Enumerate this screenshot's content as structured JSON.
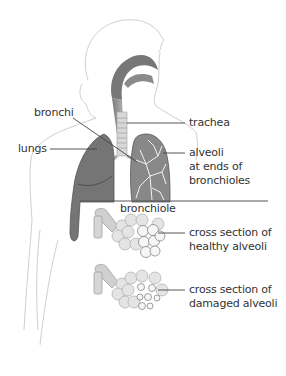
{
  "diagram": {
    "labels": {
      "bronchi": "bronchi",
      "lungs": "lungs",
      "trachea": "trachea",
      "alveoli_line1": "alveoli",
      "alveoli_line2": "at ends of",
      "alveoli_line3": "bronchioles",
      "bronchiole": "bronchiole",
      "healthy_line1": "cross section of",
      "healthy_line2": "healthy alveoli",
      "damaged_line1": "cross section of",
      "damaged_line2": "damaged alveoli"
    },
    "colors": {
      "outline": "#c8c8c8",
      "lung_dark": "#6e6e6e",
      "lung_mid": "#8a8a8a",
      "airway": "#9a9a9a",
      "alveoli_fill": "#e2e2e2",
      "alveoli_stroke": "#a8a8a8",
      "leader_line": "#444444",
      "text": "#333333"
    }
  }
}
